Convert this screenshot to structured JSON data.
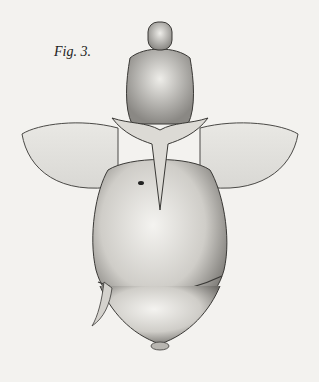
{
  "figure": {
    "label": "Fig. 3."
  }
}
